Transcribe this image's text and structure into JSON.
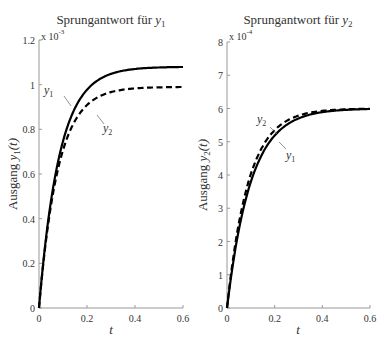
{
  "chart_data": [
    {
      "type": "line",
      "title": "Sprungantwort für y1",
      "title_prefix": "Sprungantwort für ",
      "title_var": "y",
      "title_sub": "1",
      "xlabel": "t",
      "ylabel": "Ausgang y1(t)",
      "ylabel_prefix": "Ausgang ",
      "ylabel_var": "y",
      "ylabel_sub": "1",
      "ylabel_suffix": "(t)",
      "y_scale_label": "x 10",
      "y_scale_exp": "-3",
      "xlim": [
        0,
        0.6
      ],
      "ylim": [
        0,
        1.2
      ],
      "xticks": [
        "0",
        "0.2",
        "0.4",
        "0.6"
      ],
      "yticks": [
        "0",
        "0.2",
        "0.4",
        "0.6",
        "0.8",
        "1",
        "1.2"
      ],
      "series": [
        {
          "name": "y1",
          "style": "solid",
          "final": 1.08,
          "tau": 0.085
        },
        {
          "name": "y2",
          "style": "dashed",
          "final": 0.99,
          "tau": 0.08
        }
      ],
      "annotations": [
        {
          "label": "y1",
          "sub": "1"
        },
        {
          "label": "y2",
          "sub": "2"
        }
      ]
    },
    {
      "type": "line",
      "title": "Sprungantwort für y2",
      "title_prefix": "Sprungantwort für ",
      "title_var": "y",
      "title_sub": "2",
      "xlabel": "t",
      "ylabel": "Ausgang y2(t)",
      "ylabel_prefix": "Ausgang ",
      "ylabel_var": "y",
      "ylabel_sub": "2",
      "ylabel_suffix": "(t)",
      "y_scale_label": "x 10",
      "y_scale_exp": "-4",
      "xlim": [
        0,
        0.6
      ],
      "ylim": [
        0,
        8
      ],
      "xticks": [
        "0",
        "0.2",
        "0.4",
        "0.6"
      ],
      "yticks": [
        "0",
        "1",
        "2",
        "3",
        "4",
        "5",
        "6",
        "7",
        "8"
      ],
      "series": [
        {
          "name": "y1",
          "style": "solid",
          "final": 6.0,
          "tau": 0.1
        },
        {
          "name": "y2",
          "style": "dashed",
          "final": 6.0,
          "tau": 0.09
        }
      ],
      "annotations": [
        {
          "label": "y2",
          "sub": "2"
        },
        {
          "label": "y1",
          "sub": "1"
        }
      ]
    }
  ]
}
